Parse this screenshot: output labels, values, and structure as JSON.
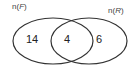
{
  "diagram": {
    "type": "venn",
    "sets": [
      {
        "name": "F",
        "label_prefix": "n(",
        "label_var": "F",
        "label_suffix": ")",
        "only_value": "14"
      },
      {
        "name": "R",
        "label_prefix": "n(",
        "label_var": "R",
        "label_suffix": ")",
        "only_value": "6"
      }
    ],
    "intersection_value": "4",
    "colors": {
      "stroke": "#333333",
      "text": "#222222",
      "background": "#ffffff"
    }
  }
}
